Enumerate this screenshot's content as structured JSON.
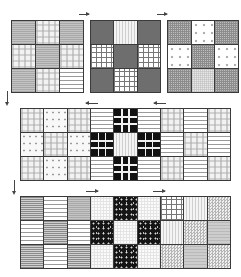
{
  "diagram": {
    "colors": {
      "border": "#3a3a3a",
      "arrow": "#444444",
      "background": "#ffffff"
    },
    "row1": {
      "blocks": [
        {
          "id": "block-a",
          "cells": [
            "gray-hstripe",
            "light-plaid",
            "gray-hstripe",
            "light-plaid",
            "gray-hstripe",
            "light-plaid",
            "gray-hstripe",
            "light-plaid",
            "white-hstripe"
          ]
        },
        {
          "id": "block-b",
          "cells": [
            "dark-solid",
            "light-vstripe",
            "dark-solid",
            "windowpane",
            "dark-solid",
            "windowpane",
            "dark-solid",
            "windowpane",
            "dark-solid"
          ]
        },
        {
          "id": "block-c",
          "cells": [
            "fine-check",
            "dots",
            "fine-check",
            "dots",
            "fine-check",
            "dots",
            "fine-check",
            "light-check",
            "fine-check"
          ]
        }
      ],
      "arrows": [
        {
          "direction": "right"
        },
        {
          "direction": "right"
        }
      ]
    },
    "row2": {
      "rows": [
        [
          "light-plaid",
          "dotted-light",
          "light-plaid",
          "white-hstripe",
          "black-plaid",
          "white-hstripe",
          "light-plaid",
          "white-hstripe",
          "light-plaid"
        ],
        [
          "dotted-light",
          "light-plaid",
          "dotted-light",
          "black-plaid",
          "light-vstripe",
          "black-plaid",
          "white-hstripe",
          "light-plaid",
          "white-hstripe"
        ],
        [
          "light-plaid",
          "dotted-light",
          "light-plaid",
          "white-hstripe",
          "black-plaid",
          "white-hstripe",
          "light-plaid",
          "white-hstripe",
          "light-plaid"
        ]
      ],
      "arrows": [
        {
          "direction": "left"
        },
        {
          "direction": "left"
        }
      ]
    },
    "row3": {
      "rows": [
        [
          "gray-hstripe-fine",
          "white-hstripe",
          "gray-hstripe",
          "light-grid",
          "black-floral",
          "light-grid",
          "windowpane",
          "light-vstripe",
          "checker"
        ],
        [
          "white-hstripe",
          "gray-hstripe-fine",
          "white-hstripe",
          "black-floral",
          "light-grid",
          "black-floral",
          "light-vstripe",
          "checker",
          "gray-hline"
        ],
        [
          "gray-hstripe-fine",
          "white-hstripe",
          "gray-hstripe-fine",
          "light-grid",
          "black-floral",
          "light-grid",
          "checker",
          "gray-hline",
          "checker"
        ]
      ],
      "arrows": [
        {
          "direction": "right"
        },
        {
          "direction": "right"
        }
      ]
    },
    "down_arrows": [
      {
        "direction": "down"
      },
      {
        "direction": "down"
      }
    ]
  }
}
